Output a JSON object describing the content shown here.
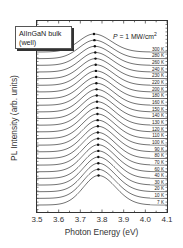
{
  "chart_data": {
    "type": "line",
    "title": "",
    "legend_box": [
      "AlInGaN bulk",
      "(well)"
    ],
    "annotation": {
      "symbol": "P",
      "text": " = 1 MW/cm",
      "superscript": "2"
    },
    "xlabel": "Photon Energy (eV)",
    "ylabel": "PL Intensity (arb. units)",
    "xlim": [
      3.5,
      4.1
    ],
    "xticks": [
      "3.5",
      "3.6",
      "3.7",
      "3.8",
      "3.9",
      "4.0",
      "4.1"
    ],
    "grid": false,
    "series": [
      {
        "name": "300 K",
        "peak_eV": 3.763,
        "rel_amp": 18
      },
      {
        "name": "280 K",
        "peak_eV": 3.765,
        "rel_amp": 18.5
      },
      {
        "name": "260 K",
        "peak_eV": 3.767,
        "rel_amp": 19
      },
      {
        "name": "240 K",
        "peak_eV": 3.769,
        "rel_amp": 19.5
      },
      {
        "name": "230 K",
        "peak_eV": 3.77,
        "rel_amp": 20
      },
      {
        "name": "220 K",
        "peak_eV": 3.771,
        "rel_amp": 20.5
      },
      {
        "name": "200 K",
        "peak_eV": 3.772,
        "rel_amp": 21
      },
      {
        "name": "180 K",
        "peak_eV": 3.773,
        "rel_amp": 21.5
      },
      {
        "name": "160 K",
        "peak_eV": 3.774,
        "rel_amp": 22
      },
      {
        "name": "150 K",
        "peak_eV": 3.775,
        "rel_amp": 22.5
      },
      {
        "name": "140 K",
        "peak_eV": 3.776,
        "rel_amp": 23
      },
      {
        "name": "130 K",
        "peak_eV": 3.777,
        "rel_amp": 23.5
      },
      {
        "name": "120 K",
        "peak_eV": 3.778,
        "rel_amp": 24
      },
      {
        "name": "110 K",
        "peak_eV": 3.779,
        "rel_amp": 24.5
      },
      {
        "name": "100 K",
        "peak_eV": 3.78,
        "rel_amp": 25
      },
      {
        "name": "90 K",
        "peak_eV": 3.781,
        "rel_amp": 25.5
      },
      {
        "name": "80 K",
        "peak_eV": 3.781,
        "rel_amp": 26
      },
      {
        "name": "70 K",
        "peak_eV": 3.782,
        "rel_amp": 26.5
      },
      {
        "name": "60 K",
        "peak_eV": 3.782,
        "rel_amp": 27
      },
      {
        "name": "40 K",
        "peak_eV": 3.783,
        "rel_amp": 27.5
      },
      {
        "name": "30 K",
        "peak_eV": 3.783,
        "rel_amp": 28
      },
      {
        "name": "20 K",
        "peak_eV": 3.783,
        "rel_amp": 28.5
      },
      {
        "name": "10 K",
        "peak_eV": 3.783,
        "rel_amp": 29
      },
      {
        "name": "7 K",
        "peak_eV": 3.784,
        "rel_amp": 29.5
      }
    ],
    "peak_marker": "filled-dot",
    "curve_offset": "vertically stacked, 300 K on top"
  },
  "labels": {
    "legend_line1": "AlInGaN bulk",
    "legend_line2": "(well)",
    "annot_symbol": "P",
    "annot_text": " = 1 MW/cm",
    "annot_sup": "2",
    "xlabel": "Photon Energy (eV)",
    "ylabel": "PL Intensity (arb. units)"
  }
}
